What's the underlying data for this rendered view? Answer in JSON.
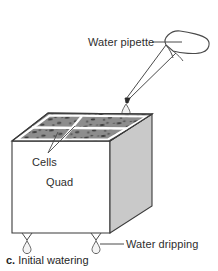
{
  "figure": {
    "caption_key": "c.",
    "caption_text": "Initial watering",
    "labels": {
      "water_pipette": "Water pipette",
      "cells": "Cells",
      "quad": "Quad",
      "water_dripping": "Water dripping"
    },
    "colors": {
      "outline": "#3b3b3b",
      "top_face_soil": "#8e8e8e",
      "top_face_speckle": "#3a3a3a",
      "right_face": "#c9c9c9",
      "front_face": "#ffffff",
      "grid_line": "#ffffff",
      "droplet_outline": "#555555",
      "background": "#ffffff",
      "text": "#2e2e2e"
    },
    "elements": {
      "pipette": "water-pipette",
      "pipette_droplet": "droplet-from-pipette",
      "quad_block": "soil-quad-block",
      "cell_grid": "cell-grid-on-top-face",
      "bottom_droplets": "two-droplets-under-block"
    },
    "grid": {
      "rows": 2,
      "columns": 2,
      "cell_count": 4
    }
  }
}
